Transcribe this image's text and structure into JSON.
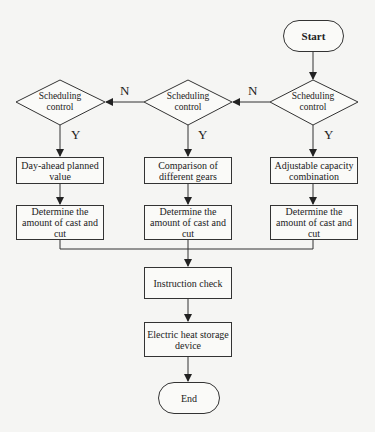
{
  "diagram": {
    "type": "flowchart",
    "start": {
      "label": "Start"
    },
    "end": {
      "label": "End"
    },
    "decisions": [
      {
        "id": "d-left",
        "label_line1": "Scheduling",
        "label_line2": "control"
      },
      {
        "id": "d-middle",
        "label_line1": "Scheduling",
        "label_line2": "control"
      },
      {
        "id": "d-right",
        "label_line1": "Scheduling",
        "label_line2": "control"
      }
    ],
    "branch_labels": {
      "no": "N",
      "yes": "Y"
    },
    "method_boxes": [
      {
        "label": "Day-ahead planned value"
      },
      {
        "label": "Comparison of different gears"
      },
      {
        "label": "Adjustable capacity combination"
      }
    ],
    "determine_boxes": [
      {
        "label": "Determine the amount of cast and cut"
      },
      {
        "label": "Determine the amount of cast and cut"
      },
      {
        "label": "Determine the amount of cast and cut"
      }
    ],
    "instruction_check": {
      "label": "Instruction check"
    },
    "storage_device": {
      "label": "Electric heat storage device"
    },
    "edges": [
      {
        "from": "Start",
        "to": "d-right"
      },
      {
        "from": "d-right",
        "to": "d-middle",
        "label": "N"
      },
      {
        "from": "d-middle",
        "to": "d-left",
        "label": "N"
      },
      {
        "from": "d-right",
        "to": "Adjustable capacity combination",
        "label": "Y"
      },
      {
        "from": "d-middle",
        "to": "Comparison of different gears",
        "label": "Y"
      },
      {
        "from": "d-left",
        "to": "Day-ahead planned value",
        "label": "Y"
      },
      {
        "from": "method boxes",
        "to": "Determine the amount of cast and cut"
      },
      {
        "from": "Determine boxes (merged)",
        "to": "Instruction check"
      },
      {
        "from": "Instruction check",
        "to": "Electric heat storage device"
      },
      {
        "from": "Electric heat storage device",
        "to": "End"
      }
    ]
  }
}
